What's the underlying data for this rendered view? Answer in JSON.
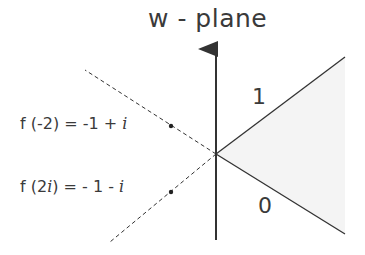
{
  "title": "w - plane",
  "regions": {
    "upper_label": "1",
    "lower_label": "0"
  },
  "annotations": [
    {
      "lhs": "f (-2) = -1 + ",
      "imag": "i"
    },
    {
      "lhs": "f (2",
      "imag_arg": "i",
      "mid": ") = - 1 - ",
      "imag": "i"
    }
  ],
  "colors": {
    "line": "#333333",
    "shade": "#f4f4f4"
  }
}
